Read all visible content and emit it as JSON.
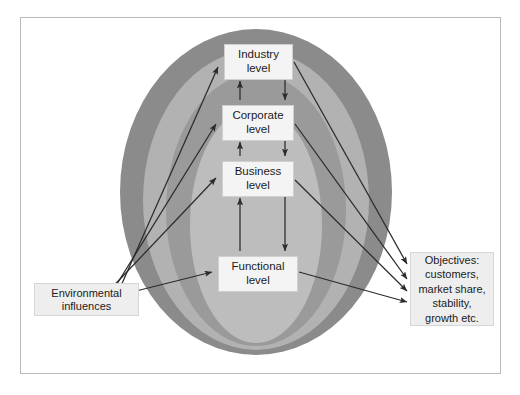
{
  "figure": {
    "kind": "nested-ellipse-levels-diagram",
    "frame": {
      "border_color": "#b9b9b9",
      "background": "#ffffff"
    }
  },
  "rings": {
    "label": "nested strategy level bands",
    "bands": [
      {
        "name": "industry-ring",
        "color": "#8b8b8b"
      },
      {
        "name": "corporate-ring",
        "color": "#b2b2b2"
      },
      {
        "name": "business-ring",
        "color": "#9a9a9a"
      },
      {
        "name": "functional-ring",
        "color": "#bdbdbd"
      }
    ]
  },
  "levels": [
    {
      "id": "industry",
      "label": "Industry\nlevel"
    },
    {
      "id": "corporate",
      "label": "Corporate\nlevel"
    },
    {
      "id": "business",
      "label": "Business\nlevel"
    },
    {
      "id": "functional",
      "label": "Functional\nlevel"
    }
  ],
  "inputs": {
    "environmental": {
      "label": "Environmental\ninfluences"
    }
  },
  "outputs": {
    "objectives": {
      "label": "Objectives:\ncustomers,\nmarket share,\nstability,\ngrowth etc."
    }
  },
  "connectors": {
    "influence_arrows": "environmental influences into each level",
    "level_arrows": "bidirectional flow between adjacent levels",
    "objective_arrows": "each level out to objectives"
  },
  "colors": {
    "arrow": "#2b2b2b",
    "box_fill": "#f2f2f2",
    "box_border": "#cfcfcf",
    "text": "#1b1b1b"
  }
}
